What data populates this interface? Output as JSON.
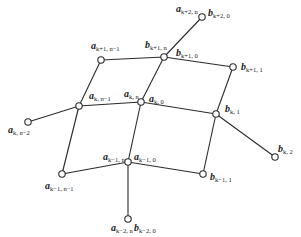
{
  "diagram": {
    "type": "quad-mesh-vertex-neighborhood",
    "nodes": [
      {
        "id": "top",
        "x": 202,
        "y": 17,
        "labels": [
          {
            "base": "a",
            "sub": "k+2, n",
            "x": 176,
            "y": 12
          },
          {
            "base": "b",
            "sub": "k+2, 0",
            "x": 208,
            "y": 16
          }
        ]
      },
      {
        "id": "kp1n",
        "x": 164,
        "y": 57,
        "labels": [
          {
            "base": "b",
            "sub": "k+1, n",
            "x": 145,
            "y": 48
          },
          {
            "base": "b",
            "sub": "k+1, 0",
            "x": 176,
            "y": 56
          }
        ]
      },
      {
        "id": "kp1nm1",
        "x": 101,
        "y": 60,
        "labels": [
          {
            "base": "a",
            "sub": "k+1, n−1",
            "x": 91,
            "y": 49
          }
        ]
      },
      {
        "id": "kp11",
        "x": 233,
        "y": 67,
        "labels": [
          {
            "base": "b",
            "sub": "k+1, 1",
            "x": 241,
            "y": 70
          }
        ]
      },
      {
        "id": "knm1",
        "x": 79,
        "y": 106,
        "labels": [
          {
            "base": "a",
            "sub": "k, n−1",
            "x": 89,
            "y": 99
          }
        ]
      },
      {
        "id": "kn",
        "x": 141,
        "y": 102,
        "labels": [
          {
            "base": "a",
            "sub": "k, n",
            "x": 124,
            "y": 97
          },
          {
            "base": "a",
            "sub": "k, 0",
            "x": 149,
            "y": 102
          }
        ]
      },
      {
        "id": "k1",
        "x": 216,
        "y": 114,
        "labels": [
          {
            "base": "b",
            "sub": "k, 1",
            "x": 225,
            "y": 112
          }
        ]
      },
      {
        "id": "knm2",
        "x": 28,
        "y": 122,
        "labels": [
          {
            "base": "a",
            "sub": "k, n−2",
            "x": 8,
            "y": 133
          }
        ]
      },
      {
        "id": "k2",
        "x": 275,
        "y": 157,
        "labels": [
          {
            "base": "b",
            "sub": "k, 2",
            "x": 278,
            "y": 152
          }
        ]
      },
      {
        "id": "km1nm1",
        "x": 62,
        "y": 174,
        "labels": [
          {
            "base": "a",
            "sub": "k−1, n−1",
            "x": 45,
            "y": 189
          }
        ]
      },
      {
        "id": "km1n",
        "x": 128,
        "y": 162,
        "labels": [
          {
            "base": "a",
            "sub": "k−1, n",
            "x": 103,
            "y": 160
          },
          {
            "base": "a",
            "sub": "k−1, 0",
            "x": 134,
            "y": 160
          }
        ]
      },
      {
        "id": "km11",
        "x": 203,
        "y": 174,
        "labels": [
          {
            "base": "b",
            "sub": "k−1, 1",
            "x": 210,
            "y": 180
          }
        ]
      },
      {
        "id": "bottom",
        "x": 128,
        "y": 219,
        "labels": [
          {
            "base": "a",
            "sub": "k−2, n",
            "x": 111,
            "y": 231
          },
          {
            "base": "b",
            "sub": "k−2, 0",
            "x": 134,
            "y": 231
          }
        ]
      }
    ],
    "edges": [
      [
        "top",
        "kp1n"
      ],
      [
        "kp1nm1",
        "kp1n"
      ],
      [
        "kp1n",
        "kp11"
      ],
      [
        "kp1nm1",
        "knm1"
      ],
      [
        "kp1n",
        "kn"
      ],
      [
        "kp11",
        "k1"
      ],
      [
        "knm2",
        "knm1"
      ],
      [
        "knm1",
        "kn"
      ],
      [
        "kn",
        "k1"
      ],
      [
        "k1",
        "k2"
      ],
      [
        "knm1",
        "km1nm1"
      ],
      [
        "kn",
        "km1n"
      ],
      [
        "k1",
        "km11"
      ],
      [
        "km1nm1",
        "km1n"
      ],
      [
        "km1n",
        "km11"
      ],
      [
        "km1n",
        "bottom"
      ]
    ]
  }
}
